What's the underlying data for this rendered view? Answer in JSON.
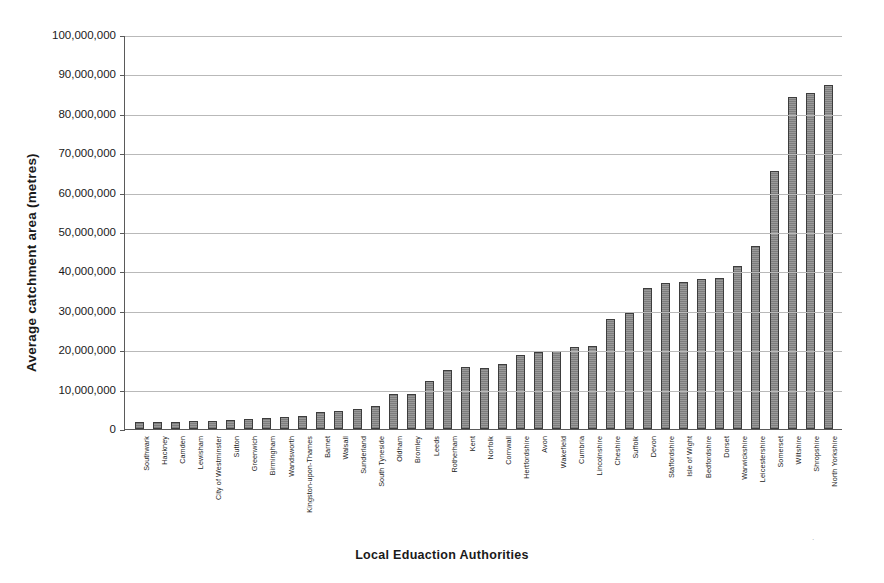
{
  "chart_data": {
    "type": "bar",
    "title": "",
    "xlabel": "Local Eduaction Authorities",
    "ylabel": "Average catchment area (metres)",
    "ylim": [
      0,
      100000000
    ],
    "ytick_step": 10000000,
    "ytick_labels": [
      "100,000,000",
      "90,000,000",
      "80,000,000",
      "70,000,000",
      "60,000,000",
      "50,000,000",
      "40,000,000",
      "30,000,000",
      "20,000,000",
      "10,000,000",
      "0"
    ],
    "grid": true,
    "legend": "none",
    "bar_color": "#8a8a8a",
    "bar_edge_color": "#3d3d3d",
    "categories": [
      "Southwark",
      "Hackney",
      "Camden",
      "Lewisham",
      "City of Westminster",
      "Sutton",
      "Greenwich",
      "Birmingham",
      "Wandsworth",
      "Kingston-upon-Thames",
      "Barnet",
      "Walsall",
      "Sunderland",
      "South Tyneside",
      "Oldham",
      "Bromley",
      "Leeds",
      "Rotherham",
      "Kent",
      "Norfolk",
      "Cornwall",
      "Hertfordshire",
      "Avon",
      "Wakefield",
      "Cumbria",
      "Lincolnshire",
      "Cheshire",
      "Suffolk",
      "Devon",
      "Staffordshire",
      "Isle of Wight",
      "Bedfordshire",
      "Dorset",
      "Warwickshire",
      "Leicestershire",
      "Somerset",
      "Wiltshire",
      "Shropshire",
      "North Yorkshire"
    ],
    "values": [
      1700000,
      1800000,
      1900000,
      2000000,
      2100000,
      2400000,
      2500000,
      2800000,
      3100000,
      3300000,
      4300000,
      4600000,
      5200000,
      5800000,
      9000000,
      8800000,
      12200000,
      15000000,
      15800000,
      15500000,
      16500000,
      18800000,
      19500000,
      19800000,
      20800000,
      21000000,
      28000000,
      29500000,
      35800000,
      37000000,
      37200000,
      38200000,
      38300000,
      41500000,
      46500000,
      65500000,
      84200000,
      85200000,
      87200000
    ]
  }
}
